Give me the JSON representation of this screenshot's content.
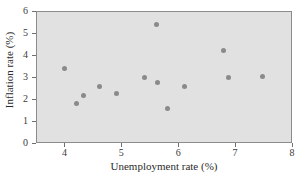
{
  "chart_data": {
    "type": "scatter",
    "title": "",
    "xlabel": "Unemployment rate (%)",
    "ylabel": "Inflation rate (%)",
    "xlim": [
      3.5,
      8.0
    ],
    "ylim": [
      0,
      6
    ],
    "xticks": [
      4,
      5,
      6,
      7,
      8
    ],
    "xtick_labels": [
      "4",
      "5",
      "6",
      "7",
      "8"
    ],
    "yticks": [
      0,
      1,
      2,
      3,
      4,
      5,
      6
    ],
    "ytick_labels": [
      "0",
      "1",
      "2",
      "3",
      "4",
      "5",
      "6"
    ],
    "grid": false,
    "legend": null,
    "plot_background_color": "#e1e1e1",
    "point_color": "#8a8a8a",
    "points": [
      {
        "x": 3.99,
        "y": 3.42
      },
      {
        "x": 4.2,
        "y": 1.82
      },
      {
        "x": 4.31,
        "y": 2.21
      },
      {
        "x": 4.6,
        "y": 2.6
      },
      {
        "x": 4.89,
        "y": 2.3
      },
      {
        "x": 5.39,
        "y": 3.02
      },
      {
        "x": 5.6,
        "y": 5.43
      },
      {
        "x": 5.61,
        "y": 2.81
      },
      {
        "x": 5.79,
        "y": 1.63
      },
      {
        "x": 6.09,
        "y": 2.62
      },
      {
        "x": 6.78,
        "y": 4.23
      },
      {
        "x": 6.87,
        "y": 3.03
      },
      {
        "x": 7.47,
        "y": 3.05
      }
    ]
  }
}
